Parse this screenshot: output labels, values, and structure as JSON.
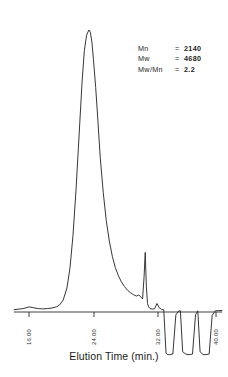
{
  "figure": {
    "caption": "Elution Time (min.)",
    "background_color": "#ffffff",
    "trace_color": "#2b2b2b"
  },
  "annotations": {
    "rows": [
      {
        "key": "Mn",
        "eq": "=",
        "value": "2140"
      },
      {
        "key": "Mw",
        "eq": "=",
        "value": "4680"
      },
      {
        "key": "Mw/Mn",
        "eq": "=",
        "value": "2.2"
      }
    ]
  },
  "axis": {
    "tick_labels": [
      "16.00",
      "24.00",
      "32.00",
      "40.00"
    ]
  },
  "chart_data": {
    "type": "line",
    "title": "",
    "subtitle": "",
    "xlabel": "Elution Time (min.)",
    "ylabel": "",
    "xlim": [
      14.0,
      41.5
    ],
    "ylim": [
      -0.22,
      1.0
    ],
    "grid": false,
    "legend": null,
    "xticks": [
      16.0,
      24.0,
      32.0,
      40.0
    ],
    "xticklabels": [
      "16.00",
      "24.00",
      "32.00",
      "40.00"
    ],
    "annotations": [
      {
        "text": "Mn      = 2140",
        "x": 30.5,
        "y": 0.86
      },
      {
        "text": "Mw      = 4680",
        "x": 30.5,
        "y": 0.81
      },
      {
        "text": "Mw/Mn = 2.2",
        "x": 30.5,
        "y": 0.76
      }
    ],
    "series": [
      {
        "name": "detector-response",
        "x": [
          14.0,
          15.2,
          16.0,
          16.6,
          17.2,
          17.8,
          18.4,
          19.0,
          19.6,
          20.0,
          20.5,
          21.0,
          21.4,
          21.8,
          22.2,
          22.6,
          23.0,
          23.3,
          23.6,
          23.9,
          24.1,
          24.3,
          24.5,
          24.8,
          25.1,
          25.4,
          25.8,
          26.2,
          26.6,
          27.0,
          27.4,
          27.8,
          28.2,
          28.6,
          29.0,
          29.4,
          29.8,
          30.2,
          30.5,
          30.8,
          31.0,
          31.2,
          31.35,
          31.5,
          31.65,
          31.8,
          32.0,
          32.3,
          32.6,
          32.9,
          33.2,
          33.5,
          33.8,
          34.1,
          34.3,
          34.6,
          35.0,
          35.4,
          35.8,
          36.0,
          36.3,
          36.7,
          37.0,
          37.3,
          37.6,
          38.0,
          38.3,
          38.6,
          39.0,
          39.4,
          39.8,
          40.2,
          40.6,
          41.0,
          41.5
        ],
        "y": [
          0.008,
          0.012,
          0.018,
          0.015,
          0.012,
          0.011,
          0.012,
          0.014,
          0.018,
          0.024,
          0.042,
          0.085,
          0.155,
          0.27,
          0.43,
          0.62,
          0.81,
          0.92,
          0.975,
          0.993,
          0.985,
          0.95,
          0.89,
          0.79,
          0.67,
          0.545,
          0.42,
          0.322,
          0.25,
          0.196,
          0.156,
          0.128,
          0.106,
          0.09,
          0.077,
          0.068,
          0.061,
          0.056,
          0.06,
          0.052,
          0.046,
          0.125,
          0.21,
          0.09,
          0.03,
          0.018,
          0.012,
          0.01,
          0.012,
          0.03,
          0.015,
          0.009,
          0.008,
          -0.145,
          -0.15,
          -0.15,
          -0.148,
          -0.01,
          0.004,
          0.004,
          -0.14,
          -0.148,
          -0.15,
          -0.15,
          -0.148,
          -0.01,
          0.004,
          -0.14,
          -0.15,
          -0.15,
          -0.148,
          -0.012,
          0.004,
          0.005,
          0.005
        ]
      }
    ]
  }
}
